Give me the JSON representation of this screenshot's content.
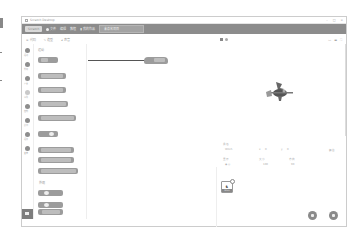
{
  "window": {
    "title": "Scratch Desktop",
    "controls": [
      "–",
      "□",
      "×"
    ]
  },
  "menubar": {
    "logo": "Scratch",
    "items": [
      {
        "icon": "globe-icon",
        "label": "文件"
      },
      {
        "label": "编辑"
      },
      {
        "label": "教程"
      },
      {
        "icon": "tutorial-icon",
        "label": "我的作品"
      }
    ],
    "project_title": "未命名项目"
  },
  "tabs": [
    {
      "icon": "code-icon",
      "label": "代码"
    },
    {
      "icon": "brush-icon",
      "label": "造型"
    },
    {
      "icon": "sound-icon",
      "label": "声音"
    }
  ],
  "categories": [
    {
      "label": "运动"
    },
    {
      "label": "外观"
    },
    {
      "label": "声音"
    },
    {
      "label": "事件"
    },
    {
      "label": "控制"
    },
    {
      "label": "侦测"
    },
    {
      "label": "运算"
    },
    {
      "label": "变量"
    }
  ],
  "palette": {
    "section_motion": "运动",
    "section_looks": "外观",
    "blocks": [
      "移动 10 步",
      "右转 15 度",
      "左转 15 度",
      "移到 随机位置",
      "移到 x: 0 y: 0",
      "在 1 秒内滑行到 随机位置",
      "在 1 秒内滑行到 x: 0 y: 0",
      "面向 90 方向",
      "说 你好!",
      "说 你好! 2 秒"
    ]
  },
  "script_area": {
    "dragged_block": "移动 10 步"
  },
  "stage": {
    "sprite": "witch-sprite",
    "view_modes": [
      "small-stage",
      "large-stage",
      "fullscreen"
    ]
  },
  "sprite_info": {
    "sprite_label": "角色",
    "sprite_name": "Witch",
    "x_label": "x",
    "x_value": "0",
    "y_label": "y",
    "y_value": "0",
    "show_label": "显示",
    "size_label": "大小",
    "size_value": "100",
    "direction_label": "方向",
    "direction_value": "90"
  },
  "sprites": [
    {
      "name": "Witch"
    }
  ],
  "stage_panel": {
    "label": "舞台",
    "backdrops": "背景 1"
  }
}
